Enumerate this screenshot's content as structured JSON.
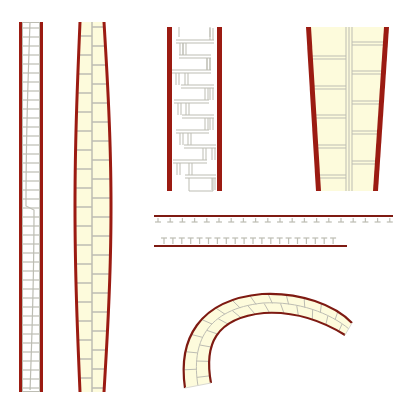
{
  "colors": {
    "background": "#ffffff",
    "wall_red": "#9b1b12",
    "wall_red_dark": "#7e1a12",
    "fill_cream": "#fdfbdc",
    "grid_gray": "#bdbdb3",
    "grid_light": "#d9d9d2"
  },
  "elements": [
    {
      "id": "wall-straight-narrow",
      "type": "straight-wall",
      "fill": "white",
      "pattern": "staggered-ladder"
    },
    {
      "id": "wall-bulged",
      "type": "bulged-wall",
      "fill": "cream",
      "pattern": "ladder-two-column"
    },
    {
      "id": "wall-zigzag-rect",
      "type": "rectangular-wall",
      "fill": "white",
      "pattern": "staggered-H-blocks"
    },
    {
      "id": "wall-tapered",
      "type": "tapered-wall",
      "fill": "cream",
      "pattern": "two-column-offset-blocks"
    },
    {
      "id": "rail-top",
      "type": "rail-with-hanging-T",
      "count": 20
    },
    {
      "id": "rail-bottom",
      "type": "rail-with-standing-T",
      "count": 20
    },
    {
      "id": "curved-wall",
      "type": "curved-wall",
      "fill": "cream",
      "pattern": "brick-arc"
    }
  ]
}
